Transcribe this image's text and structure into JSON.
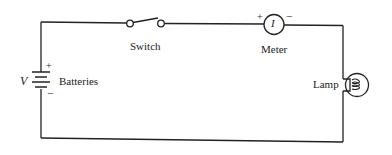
{
  "diagram": {
    "type": "circuit-schematic",
    "components": {
      "switch": {
        "label": "Switch"
      },
      "meter": {
        "label": "Meter",
        "symbol": "I",
        "plus": "+",
        "minus": "−"
      },
      "batteries": {
        "label": "Batteries",
        "voltage_symbol": "V",
        "plus": "+",
        "minus": "−"
      },
      "lamp": {
        "label": "Lamp"
      }
    }
  }
}
